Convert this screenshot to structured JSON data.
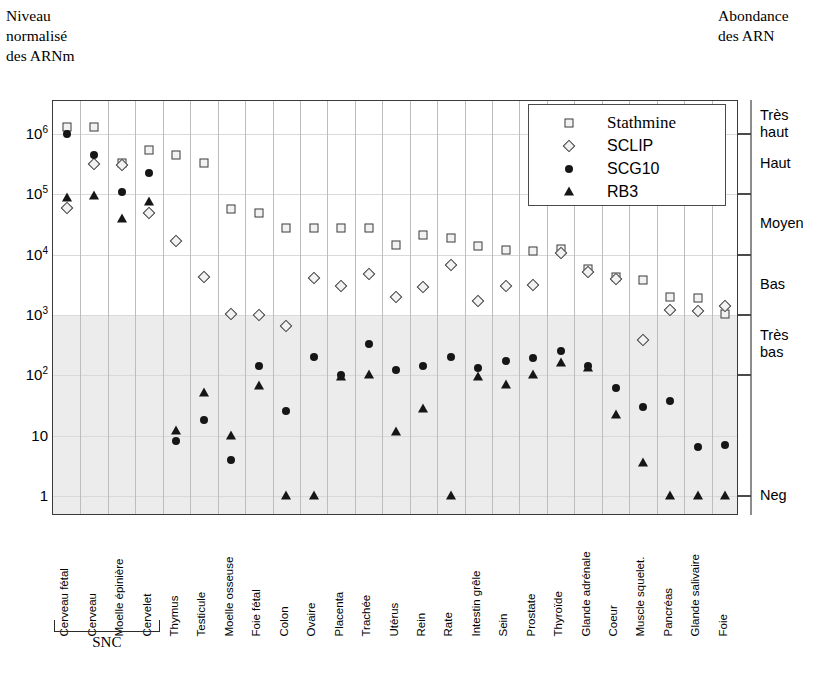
{
  "axis_titles": {
    "y_title": "Niveau\nnormalisé\ndes ARNm",
    "right_title": "Abondance\ndes ARN"
  },
  "group_bracket": {
    "label": "SNC",
    "covers": [
      "Cerveau fétal",
      "Cerveau",
      "Moelle épinière",
      "Cervelet"
    ]
  },
  "legend": {
    "entries": [
      {
        "label": "Stathmine",
        "marker": "square-open",
        "color": "#3c3c3c"
      },
      {
        "label": "SCLIP",
        "marker": "diamond-open",
        "color": "#3c3c3c"
      },
      {
        "label": "SCG10",
        "marker": "circle-filled",
        "color": "#161616"
      },
      {
        "label": "RB3",
        "marker": "triangle-filled",
        "color": "#161616"
      }
    ]
  },
  "right_axis": {
    "labels": [
      "Très\nhaut",
      "Haut",
      "Moyen",
      "Bas",
      "Très\nbas",
      "Neg"
    ],
    "tick_values": [
      1000000,
      100000,
      10000,
      1000,
      100,
      1
    ]
  },
  "chart_data": {
    "type": "scatter",
    "title": "",
    "xlabel": "",
    "ylabel": "Niveau normalisé des ARNm",
    "yscale": "log",
    "ylim": [
      1,
      3000000
    ],
    "ytick_labels": [
      "10⁶",
      "10⁵",
      "10⁴",
      "10³",
      "10²",
      "10",
      "1"
    ],
    "ytick_values": [
      1000000,
      100000,
      10000,
      1000,
      100,
      10,
      1
    ],
    "grid": "vertical-and-horizontal-light",
    "legend_position": "top-right-inside",
    "shaded_band": {
      "from": 1,
      "to": 1000,
      "meaning": "Bas / Très bas / Neg",
      "color": "#e9e9e9"
    },
    "categories": [
      "Cerveau fétal",
      "Cerveau",
      "Moelle épinière",
      "Cervelet",
      "Thymus",
      "Testicule",
      "Moelle osseuse",
      "Foie fétal",
      "Colon",
      "Ovaire",
      "Placenta",
      "Trachée",
      "Utérus",
      "Rein",
      "Rate",
      "Intestin grêle",
      "Sein",
      "Prostate",
      "Thyroïde",
      "Glande adrénale",
      "Coeur",
      "Muscle squelet.",
      "Pancréas",
      "Glande salivaire",
      "Foie"
    ],
    "series": [
      {
        "name": "Stathmine",
        "marker": "square-open",
        "values": [
          1300000,
          1300000,
          330000,
          530000,
          440000,
          330000,
          56000,
          48000,
          28000,
          28000,
          28000,
          28000,
          14500,
          21000,
          19000,
          14000,
          12000,
          11500,
          12500,
          5800,
          4300,
          3800,
          2000,
          1900,
          1050
        ]
      },
      {
        "name": "SCLIP",
        "marker": "diamond-open",
        "values": [
          60000,
          320000,
          300000,
          48000,
          17000,
          4200,
          1050,
          1000,
          650,
          4100,
          3000,
          4800,
          2000,
          2900,
          6700,
          1700,
          3000,
          3100,
          10500,
          5200,
          4000,
          380,
          1200,
          1150,
          1400
        ]
      },
      {
        "name": "SCG10",
        "marker": "circle-filled",
        "values": [
          1000000,
          440000,
          110000,
          220000,
          8,
          18,
          4,
          140,
          26,
          200,
          100,
          330,
          120,
          145,
          200,
          130,
          175,
          190,
          250,
          140,
          62,
          30,
          37,
          6.5,
          7
        ]
      },
      {
        "name": "RB3",
        "marker": "triangle-filled",
        "values": [
          85000,
          95000,
          39000,
          75000,
          12,
          50,
          10,
          66,
          1,
          1,
          93,
          100,
          11.5,
          28,
          1,
          95,
          70,
          100,
          160,
          130,
          22,
          3.5,
          1,
          1,
          1
        ]
      }
    ]
  }
}
